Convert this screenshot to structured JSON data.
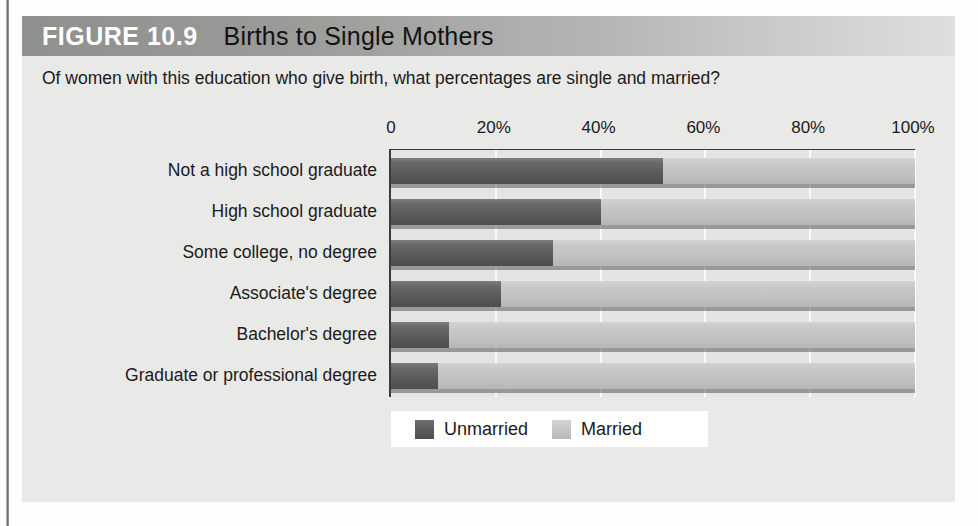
{
  "figure": {
    "number_label": "FIGURE 10.9",
    "title": "Births to Single Mothers",
    "subtitle": "Of women with this education who give birth, what percentages are single and married?"
  },
  "colors": {
    "unmarried": "#5b5b59",
    "married": "#c4c4c2",
    "panel_bg": "#e9e9e7",
    "plot_bg": "#e4e4e2",
    "axis": "#3a3a3a",
    "title_bar_start": "#8f8f8d",
    "title_bar_end": "#dedede"
  },
  "legend": {
    "position": "bottom-left",
    "entries": [
      {
        "label": "Unmarried",
        "color": "#5b5b59"
      },
      {
        "label": "Married",
        "color": "#c4c4c2"
      }
    ]
  },
  "chart_data": {
    "type": "bar",
    "orientation": "horizontal",
    "stacked": true,
    "stack_total": 100,
    "title": "Births to Single Mothers",
    "subtitle": "Of women with this education who give birth, what percentages are single and married?",
    "xlabel": "",
    "ylabel": "",
    "xlim": [
      0,
      100
    ],
    "grid": true,
    "grid_axis": "x",
    "categories": [
      "Not a high school graduate",
      "High school graduate",
      "Some college, no degree",
      "Associate's degree",
      "Bachelor's degree",
      "Graduate or professional degree"
    ],
    "tick_values": [
      0,
      20,
      40,
      60,
      80,
      100
    ],
    "tick_labels": [
      "0",
      "20%",
      "40%",
      "60%",
      "80%",
      "100%"
    ],
    "series": [
      {
        "name": "Unmarried",
        "color": "#5b5b59",
        "values": [
          52,
          40,
          31,
          21,
          11,
          9
        ]
      },
      {
        "name": "Married",
        "color": "#c4c4c2",
        "values": [
          48,
          60,
          69,
          79,
          89,
          91
        ]
      }
    ]
  }
}
